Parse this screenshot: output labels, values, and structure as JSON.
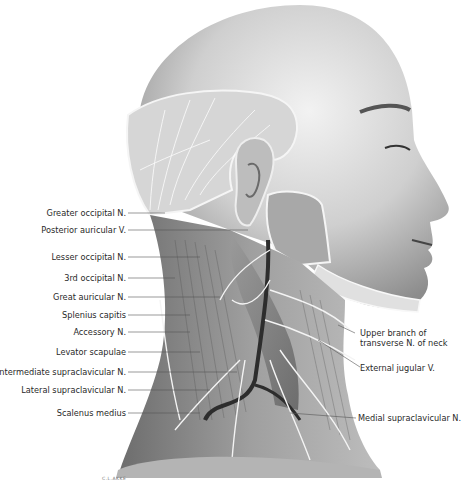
{
  "figure": {
    "signature": "C.L.AKKE"
  },
  "labels_left": [
    {
      "id": "greater-occipital-n",
      "text": "Greater occipital N."
    },
    {
      "id": "posterior-auricular-v",
      "text": "Posterior auricular V."
    },
    {
      "id": "lesser-occipital-n",
      "text": "Lesser occipital N."
    },
    {
      "id": "third-occipital-n",
      "text": "3rd occipital N."
    },
    {
      "id": "great-auricular-n",
      "text": "Great auricular N."
    },
    {
      "id": "splenius-capitis",
      "text": "Splenius capitis"
    },
    {
      "id": "accessory-n",
      "text": "Accessory N."
    },
    {
      "id": "levator-scapulae",
      "text": "Levator scapulae"
    },
    {
      "id": "intermediate-supraclavicular-n",
      "text": "Intermediate supraclavicular N."
    },
    {
      "id": "lateral-supraclavicular-n",
      "text": "Lateral supraclavicular N."
    },
    {
      "id": "scalenus-medius",
      "text": "Scalenus medius"
    }
  ],
  "labels_right": [
    {
      "id": "upper-branch-transverse-n-neck",
      "line1": "Upper branch of",
      "line2": "transverse N. of neck"
    },
    {
      "id": "external-jugular-v",
      "line1": "External jugular V."
    },
    {
      "id": "medial-supraclavicular-n",
      "line1": "Medial supraclavicular N."
    }
  ]
}
